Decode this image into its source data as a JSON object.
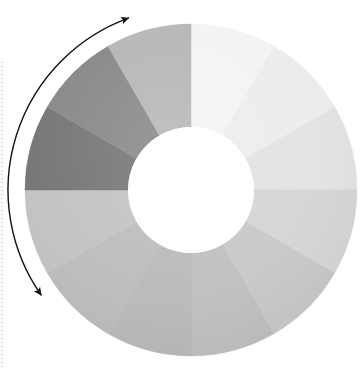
{
  "figure": {
    "title": "Grayscale colour wheel with rotation arrow",
    "background_color": "#ffffff",
    "width": 364,
    "height": 378
  },
  "wheel": {
    "name": "colour-wheel",
    "center_x": 191,
    "center_y": 190,
    "outer_radius": 166,
    "inner_radius": 63,
    "segment_count": 12,
    "start_angle_deg": -90,
    "segment_span_deg": 30
  },
  "arrow": {
    "name": "rotation-arrow",
    "style": "double-headed-curved",
    "color": "#111111",
    "stroke_width": 1.4,
    "head_start_x": 118,
    "head_start_y": 20,
    "head_end_x": 32,
    "head_end_y": 255,
    "arc_radius": 183
  },
  "margin_guide": {
    "name": "dotted-margin-line",
    "color": "#c9c9c9",
    "x": 2,
    "y_top": 62,
    "y_bottom": 368,
    "dash": "1 3"
  },
  "chart_data": {
    "type": "pie",
    "title": "Grayscale colour wheel",
    "subtitle": "",
    "xlabel": "",
    "ylabel": "",
    "legend_position": "none",
    "grid": false,
    "hole_fraction": 0.38,
    "categories": [
      "12 o'clock",
      "1 o'clock",
      "2 o'clock",
      "3 o'clock",
      "4 o'clock",
      "5 o'clock",
      "6 o'clock",
      "7 o'clock",
      "8 o'clock",
      "9 o'clock",
      "10 o'clock",
      "11 o'clock"
    ],
    "values": [
      30,
      30,
      30,
      30,
      30,
      30,
      30,
      30,
      30,
      30,
      30,
      30
    ],
    "slice_colors": [
      "#f3f3f3",
      "#ececec",
      "#e2e2e2",
      "#d5d5d5",
      "#c8c8c8",
      "#bfbfbf",
      "#b9b9b9",
      "#bcbcbc",
      "#c2c2c2",
      "#737373",
      "#868686",
      "#b5b5b5"
    ],
    "slice_labels": [
      "",
      "",
      "",
      "",
      "",
      "",
      "",
      "",
      "",
      "",
      "",
      ""
    ],
    "annotations": [
      {
        "name": "rotation-arrow",
        "text": "",
        "type": "double-headed-arc",
        "from_deg": -110,
        "to_deg": -215
      }
    ]
  }
}
